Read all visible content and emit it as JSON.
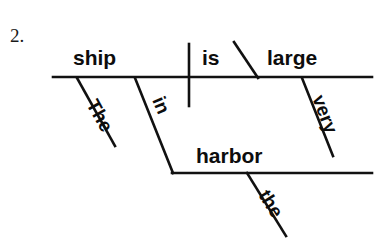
{
  "page": {
    "background_color": "#ffffff",
    "ink_color": "#111111",
    "width": 380,
    "height": 243
  },
  "exercise": {
    "number_label": "2.",
    "sentence": "The ship in the harbor is very large.",
    "diagram_type": "reed-kellogg sentence diagram"
  },
  "diagram": {
    "baseline": {
      "name": "main-baseline",
      "x1": 53,
      "y1": 77,
      "x2": 372,
      "y2": 77
    },
    "subject_verb_divider": {
      "name": "subject-verb-divider",
      "x1": 189,
      "y1": 44,
      "x2": 189,
      "y2": 106
    },
    "predicate_complement_divider": {
      "name": "predicate-adjective-divider",
      "x1": 234,
      "y1": 42,
      "x2": 258,
      "y2": 78
    },
    "prepositional_phrase_baseline": {
      "name": "prepositional-object-baseline",
      "x1": 172,
      "y1": 173,
      "x2": 372,
      "y2": 173
    },
    "words": [
      {
        "id": "subject",
        "text": "ship",
        "role": "subject",
        "x": 73,
        "y": 65,
        "rotation": 0,
        "font_size": 21
      },
      {
        "id": "verb",
        "text": "is",
        "role": "linking verb",
        "x": 202,
        "y": 65,
        "rotation": 0,
        "font_size": 21
      },
      {
        "id": "predicate-adjective",
        "text": "large",
        "role": "predicate adjective",
        "x": 267,
        "y": 65,
        "rotation": 0,
        "font_size": 21
      },
      {
        "id": "article-the-subject",
        "text": "The",
        "role": "article modifying subject",
        "x": 86,
        "y": 104,
        "rotation": 61,
        "font_size": 19
      },
      {
        "id": "preposition-in",
        "text": "in",
        "role": "preposition",
        "x": 152,
        "y": 100,
        "rotation": 67,
        "font_size": 19
      },
      {
        "id": "adverb-very",
        "text": "very",
        "role": "adverb modifying large",
        "x": 312,
        "y": 98,
        "rotation": 69,
        "font_size": 19
      },
      {
        "id": "object-of-preposition",
        "text": "harbor",
        "role": "object of preposition",
        "x": 196,
        "y": 163,
        "rotation": 0,
        "font_size": 21
      },
      {
        "id": "article-the-object",
        "text": "the",
        "role": "article modifying harbor",
        "x": 258,
        "y": 195,
        "rotation": 58,
        "font_size": 19
      }
    ],
    "modifier_lines": [
      {
        "id": "the-subject-slant",
        "label": "The",
        "x1": 77,
        "y1": 78,
        "x2": 115,
        "y2": 146
      },
      {
        "id": "in-preposition-slant",
        "label": "in",
        "x1": 135,
        "y1": 78,
        "x2": 173,
        "y2": 173
      },
      {
        "id": "very-adverb-slant",
        "label": "very",
        "x1": 302,
        "y1": 78,
        "x2": 333,
        "y2": 156
      },
      {
        "id": "the-object-slant",
        "label": "the",
        "x1": 247,
        "y1": 173,
        "x2": 286,
        "y2": 236
      }
    ]
  }
}
